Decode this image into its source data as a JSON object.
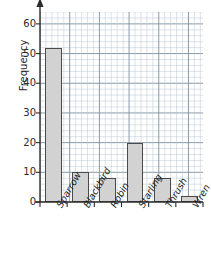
{
  "chart_data": {
    "type": "bar",
    "title": "",
    "xlabel": "",
    "ylabel": "Frequency",
    "categories": [
      "Sparrow",
      "Blackbird",
      "Robin",
      "Starling",
      "Thrush",
      "Wren"
    ],
    "values": [
      52,
      10,
      8,
      20,
      8,
      2
    ],
    "ylim": [
      0,
      64
    ],
    "yticks": [
      0,
      10,
      20,
      30,
      40,
      50,
      60
    ],
    "ytick_labels": [
      "0",
      "10",
      "20",
      "30",
      "40",
      "50",
      "60"
    ],
    "grid": {
      "visible": true,
      "style": "graph-paper",
      "minor_step": 2,
      "major_step": 10,
      "minor_color": "#b9c6d4",
      "major_color": "#7d8e9e"
    },
    "legend": {
      "visible": false
    },
    "axis": {
      "y_arrow": true,
      "y_axis_color": "#2b2b2b",
      "x_axis_color": "#2b2b2b"
    },
    "bar_style": {
      "fill": "#d2d2d2",
      "edge": "#4a4a4a",
      "label_rotation": -60
    }
  }
}
